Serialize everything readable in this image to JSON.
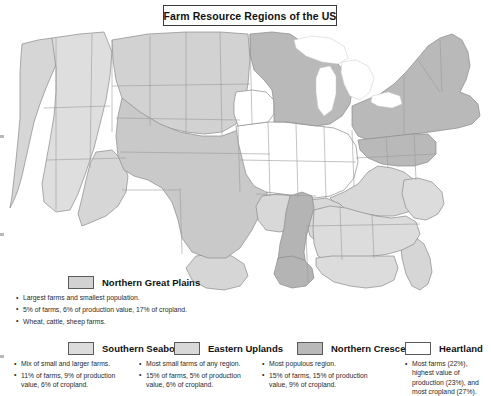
{
  "title": "Farm Resource Regions of the US",
  "map": {
    "name": "us-farm-resource-regions-map",
    "region_fills": {
      "heartland": "#ffffff",
      "northern_crescent": "#b9b9b9",
      "northern_great_plains": "#d2d2d2",
      "prairie_gateway": "#c9c9c9",
      "eastern_uplands": "#d8d8d8",
      "southern_seaboard": "#dcdcdc",
      "fruitful_rim": "#d6d6d6",
      "mississippi_portal": "#b4b4b4",
      "basin_and_range": "#dedede"
    },
    "border_color": "#8a8a8a",
    "outline_color": "#6b6b6b"
  },
  "legend": {
    "items": [
      {
        "id": "northern-great-plains",
        "label": "Northern Great Plains",
        "swatch_color": "#d2d2d2",
        "bullets": [
          "Largest farms and smallest population.",
          "5% of farms, 6% of production value, 17% of cropland.",
          "Wheat, cattle, sheep farms."
        ]
      },
      {
        "id": "southern-seaboard",
        "label": "Southern Seaboard",
        "swatch_color": "#dcdcdc",
        "bullets": [
          "Mix of small and larger farms.",
          "11% of farms, 9% of production value, 6% of cropland."
        ]
      },
      {
        "id": "eastern-uplands",
        "label": "Eastern Uplands",
        "swatch_color": "#d8d8d8",
        "bullets": [
          "Most small farms of any region.",
          "15% of farms, 5% of production value, 6% of cropland."
        ]
      },
      {
        "id": "northern-crescent",
        "label": "Northern Crescent",
        "swatch_color": "#b9b9b9",
        "bullets": [
          "Most populous region.",
          "15% of farms, 15% of production value, 9% of cropland."
        ]
      },
      {
        "id": "heartland",
        "label": "Heartland",
        "swatch_color": "#ffffff",
        "bullets": [
          "Most farms (22%), highest value of production (23%), and most cropland (27%)."
        ]
      }
    ]
  }
}
